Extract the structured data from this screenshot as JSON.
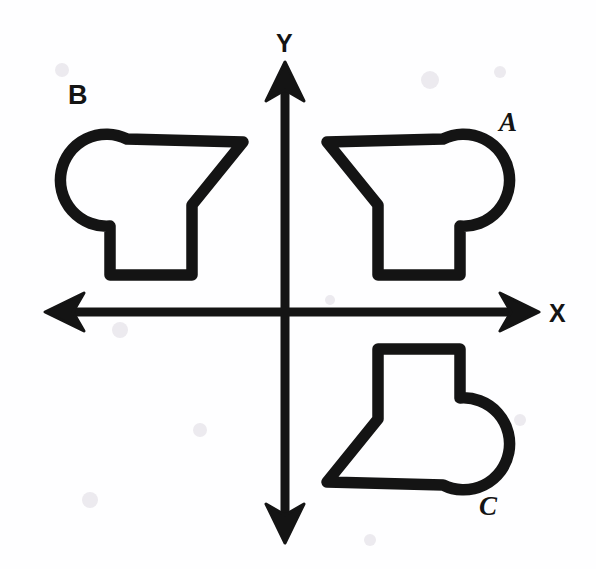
{
  "figure": {
    "background_color": "#fefeff",
    "ink_color": "#141414",
    "width": 596,
    "height": 569
  },
  "axes": {
    "origin": {
      "x": 285,
      "y": 312
    },
    "x_axis": {
      "label": "X",
      "label_position": {
        "x": 549,
        "y": 322
      },
      "left_tip": {
        "x": 45,
        "y": 312
      },
      "right_tip": {
        "x": 539,
        "y": 312
      },
      "double_headed": true
    },
    "y_axis": {
      "label": "Y",
      "label_position": {
        "x": 276,
        "y": 52
      },
      "top_tip": {
        "x": 285,
        "y": 62
      },
      "bottom_tip": {
        "x": 285,
        "y": 543
      },
      "double_headed": true
    }
  },
  "shapes": [
    {
      "id": "shape-a",
      "label": "A",
      "quadrant": "I",
      "label_position": {
        "x": 499,
        "y": 131
      },
      "description": "Hook/boot polygon with circular lobe on the right and rectangular foot below-left",
      "path": "M 327 142 L 443 139 A 46 46 0 1 1 460 226 L 460 275 L 378 275 L 378 205 Z",
      "relation_to_a": "original"
    },
    {
      "id": "shape-b",
      "label": "B",
      "quadrant": "II",
      "label_position": {
        "x": 68,
        "y": 104
      },
      "description": "Reflection of shape A across the y-axis; circular lobe on the left",
      "path": "M 243 142 L 127 139 A 46 46 0 1 0 110 226 L 110 275 L 192 275 L 192 205 Z",
      "relation_to_a": "reflection across y-axis"
    },
    {
      "id": "shape-c",
      "label": "C",
      "quadrant": "IV",
      "label_position": {
        "x": 479,
        "y": 515
      },
      "description": "Reflection of shape A across the x-axis; circular lobe on the right, rectangular top",
      "path": "M 327 482 L 443 485 A 46 46 0 1 0 460 398 L 460 349 L 378 349 L 378 419 Z",
      "relation_to_a": "reflection across x-axis"
    }
  ],
  "legend": {
    "shape_labels": [
      "A",
      "B",
      "C"
    ],
    "axis_labels": [
      "X",
      "Y"
    ]
  }
}
